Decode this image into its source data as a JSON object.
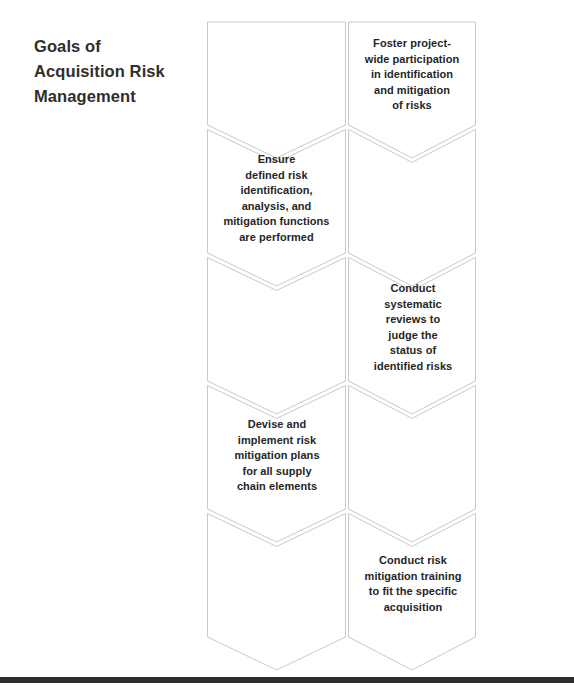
{
  "title": {
    "lines": [
      "Goals of",
      "Acquisition Risk",
      "Management"
    ],
    "full": "Goals of Acquisition Risk Management",
    "color": "#2e2e2e"
  },
  "diagram": {
    "type": "honeycomb-hexagon-list",
    "shape_fill": "#ffffff",
    "shape_stroke": "#c9c9c9",
    "text_color": "#262626",
    "hexagons": [
      {
        "id": "hex-left-row1",
        "column": "left",
        "row": 1,
        "label": "",
        "has_text": false
      },
      {
        "id": "hex-right-row1",
        "column": "right",
        "row": 1,
        "label": "Foster project-\nwide participation\nin identification\nand mitigation\nof risks",
        "has_text": true
      },
      {
        "id": "hex-left-row2",
        "column": "left",
        "row": 2,
        "label": "Ensure\ndefined risk\nidentification,\nanalysis, and\nmitigation functions\nare performed",
        "has_text": true
      },
      {
        "id": "hex-right-row2",
        "column": "right",
        "row": 2,
        "label": "",
        "has_text": false
      },
      {
        "id": "hex-left-row3",
        "column": "left",
        "row": 3,
        "label": "",
        "has_text": false
      },
      {
        "id": "hex-right-row3",
        "column": "right",
        "row": 3,
        "label": "Conduct\nsystematic\nreviews to\njudge the\nstatus of\nidentified risks",
        "has_text": true
      },
      {
        "id": "hex-left-row4",
        "column": "left",
        "row": 4,
        "label": "Devise and\nimplement risk\nmitigation plans\nfor all supply\nchain elements",
        "has_text": true
      },
      {
        "id": "hex-right-row4",
        "column": "right",
        "row": 4,
        "label": "",
        "has_text": false
      },
      {
        "id": "hex-left-row5",
        "column": "left",
        "row": 5,
        "label": "",
        "has_text": false
      },
      {
        "id": "hex-right-row5",
        "column": "right",
        "row": 5,
        "label": "Conduct risk\nmitigation training\nto fit the specific\nacquisition",
        "has_text": true
      }
    ]
  },
  "bottom_rule": {
    "color": "#2c2c2c"
  }
}
